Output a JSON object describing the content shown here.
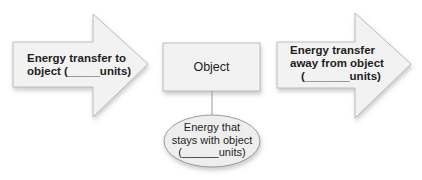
{
  "diagram": {
    "left_arrow": {
      "line1": "Energy transfer to",
      "line2": "object (_____units)"
    },
    "object_box": {
      "label": "Object"
    },
    "right_arrow": {
      "line1": "Energy transfer",
      "line2": "away from object",
      "line3": "(_______units)"
    },
    "ellipse": {
      "line1": "Energy that",
      "line2": "stays with object",
      "line3": "(______units)"
    }
  },
  "colors": {
    "fill": "#f2f2f2",
    "stroke": "#b8b8b8",
    "shadow": "#cfcfcf",
    "text": "#1e1e1e"
  }
}
